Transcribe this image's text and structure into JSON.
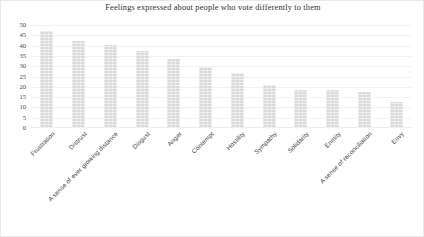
{
  "chart_data": {
    "type": "bar",
    "title": "Feelings expressed about people who vote differently to them",
    "xlabel": "",
    "ylabel": "",
    "ylim": [
      0,
      50
    ],
    "yticks": [
      0,
      5,
      10,
      15,
      20,
      25,
      30,
      35,
      40,
      45,
      50
    ],
    "grid": true,
    "legend": false,
    "bar_color": "#dadada",
    "categories": [
      "Frustration",
      "Distrust",
      "A sense of ever growing distance",
      "Disgust",
      "Anger",
      "Contempt",
      "Hostility",
      "Sympathy",
      "Solidarity",
      "Enmity",
      "A sense of reconciliation",
      "Envy"
    ],
    "values": [
      47,
      42,
      40.5,
      37.5,
      33.5,
      29.5,
      26.5,
      21,
      18.5,
      18.5,
      17.5,
      12.5
    ]
  }
}
